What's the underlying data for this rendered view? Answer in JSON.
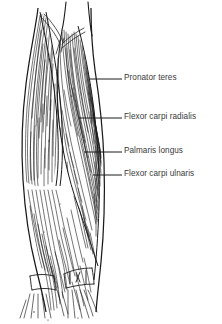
{
  "figure": {
    "background_color": "#ffffff",
    "ink_color": "#1a1a1a",
    "label_color": "#3a3a3a",
    "labels": [
      {
        "id": "pronator-teres",
        "text": "Pronator teres",
        "text_x": 124,
        "text_y": 77,
        "leader_x1": 90,
        "leader_y1": 79,
        "leader_x2": 122,
        "leader_y2": 79
      },
      {
        "id": "flexor-carpi-radialis",
        "text": "Flexor carpi radialis",
        "text_x": 124,
        "text_y": 116,
        "leader_x1": 79,
        "leader_y1": 118,
        "leader_x2": 122,
        "leader_y2": 118
      },
      {
        "id": "palmaris-longus",
        "text": "Palmaris longus",
        "text_x": 124,
        "text_y": 150,
        "leader_x1": 84,
        "leader_y1": 152,
        "leader_x2": 122,
        "leader_y2": 152
      },
      {
        "id": "flexor-carpi-ulnaris",
        "text": "Flexor carpi ulnaris",
        "text_x": 124,
        "text_y": 173,
        "leader_x1": 93,
        "leader_y1": 175,
        "leader_x2": 122,
        "leader_y2": 175
      }
    ]
  }
}
